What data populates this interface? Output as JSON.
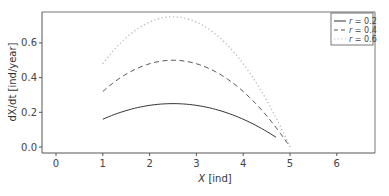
{
  "chart_data": {
    "type": "line",
    "title": "",
    "xlabel": "X [ind]",
    "ylabel": "dX/dt [ind/year]",
    "xlim": [
      -0.3,
      6.7
    ],
    "ylim": [
      -0.03,
      0.79
    ],
    "xticks": [
      0,
      1,
      2,
      3,
      4,
      5,
      6
    ],
    "yticks": [
      0.0,
      0.2,
      0.4,
      0.6
    ],
    "xtick_labels": [
      "0",
      "1",
      "2",
      "3",
      "4",
      "5",
      "6"
    ],
    "ytick_labels": [
      "0.0",
      "0.2",
      "0.4",
      "0.6"
    ],
    "grid": false,
    "legend_position": "upper right",
    "series": [
      {
        "name": "r = 0.2",
        "style": "solid",
        "color": "#333333",
        "x": [
          1.0,
          1.5,
          2.0,
          2.5,
          3.0,
          3.5,
          4.0,
          4.5,
          4.7
        ],
        "values": [
          0.16,
          0.21,
          0.24,
          0.25,
          0.24,
          0.21,
          0.16,
          0.09,
          0.056
        ]
      },
      {
        "name": "r = 0.4",
        "style": "dashed",
        "color": "#555555",
        "x": [
          1.0,
          1.5,
          2.0,
          2.5,
          3.0,
          3.5,
          4.0,
          4.5,
          5.0
        ],
        "values": [
          0.32,
          0.42,
          0.48,
          0.5,
          0.48,
          0.42,
          0.32,
          0.18,
          0.0
        ]
      },
      {
        "name": "r = 0.6",
        "style": "dotted",
        "color": "#bbbbbb",
        "x": [
          1.0,
          1.5,
          2.0,
          2.5,
          3.0,
          3.5,
          4.0,
          4.5,
          5.0
        ],
        "values": [
          0.48,
          0.63,
          0.72,
          0.75,
          0.72,
          0.63,
          0.48,
          0.27,
          0.0
        ]
      }
    ]
  },
  "legend": {
    "items": [
      {
        "label_var": "r",
        "label_rest": " = 0.2"
      },
      {
        "label_var": "r",
        "label_rest": " = 0.4"
      },
      {
        "label_var": "r",
        "label_rest": " = 0.6"
      }
    ]
  },
  "axes": {
    "xlabel_var": "X",
    "xlabel_unit": " [ind]",
    "ylabel_text": "dX/dt [ind/year]"
  }
}
